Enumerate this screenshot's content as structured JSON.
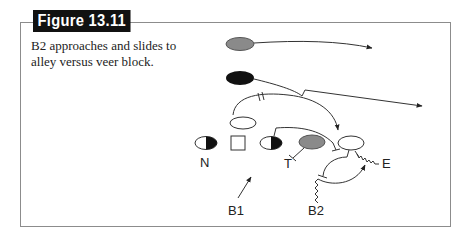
{
  "figure": {
    "label": "Figure 13.11",
    "caption": "B2 approaches and slides to alley versus veer block."
  },
  "diagram": {
    "labels": {
      "n": "N",
      "t": "T",
      "e": "E",
      "b1": "B1",
      "b2": "B2"
    },
    "colors": {
      "frame": "#8c8c8c",
      "gray_player": "#8a8a8a",
      "black_player": "#111111",
      "line": "#333333"
    }
  }
}
